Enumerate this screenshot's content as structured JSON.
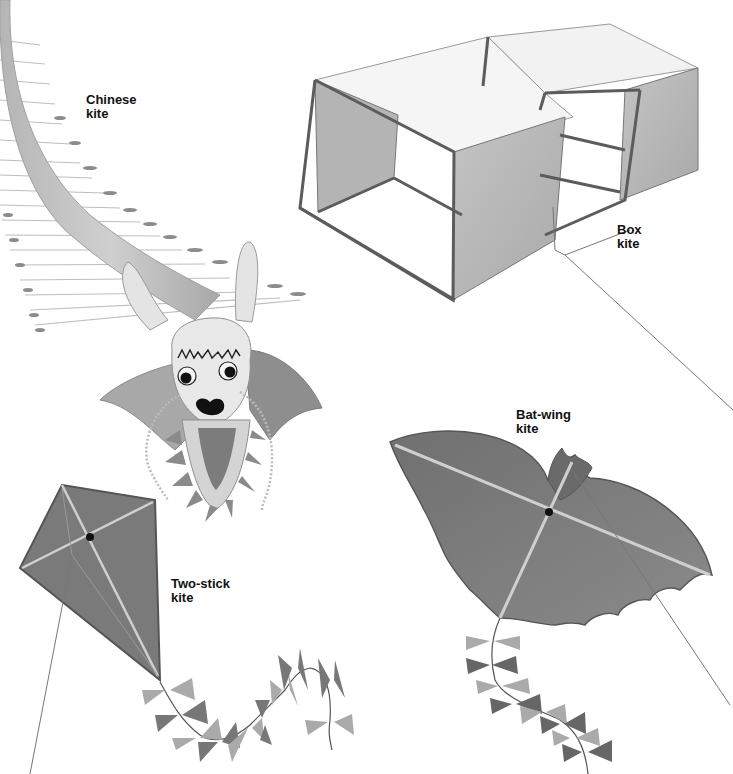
{
  "illustration": {
    "style": "grayscale",
    "background": "#ffffff",
    "kites": [
      {
        "id": "chinese",
        "label_line1": "Chinese",
        "label_line2": "kite"
      },
      {
        "id": "box",
        "label_line1": "Box",
        "label_line2": "kite"
      },
      {
        "id": "bat-wing",
        "label_line1": "Bat-wing",
        "label_line2": "kite"
      },
      {
        "id": "two-stick",
        "label_line1": "Two-stick",
        "label_line2": "kite"
      }
    ]
  },
  "colors": {
    "dark_fabric": "#6e6e6e",
    "mid_fabric": "#9a9a9a",
    "light_fabric": "#c8c8c8",
    "frame": "#555555",
    "string": "#777777",
    "label_text": "#111111"
  }
}
